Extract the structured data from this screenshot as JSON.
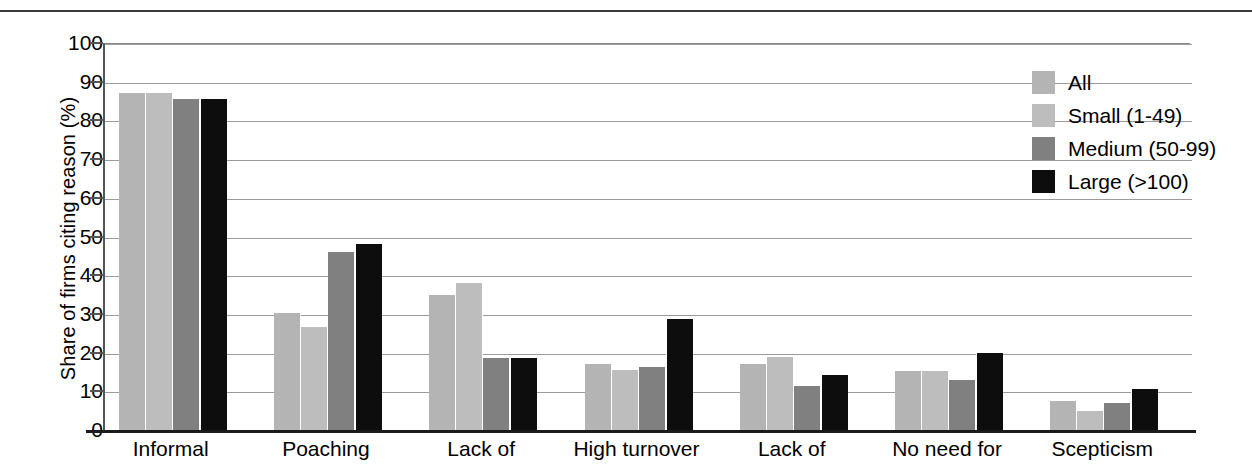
{
  "page": {
    "top_rule_cut_text": ""
  },
  "chart_data": {
    "type": "bar",
    "title": "",
    "xlabel": "",
    "ylabel": "Share of firms citing reason (%)",
    "ylim": [
      0,
      100
    ],
    "ytick_step": 10,
    "yticks": [
      0,
      10,
      20,
      30,
      40,
      50,
      60,
      70,
      80,
      90,
      100
    ],
    "grid": true,
    "legend_position": "top-right",
    "categories": [
      "Informal",
      "Poaching",
      "Lack of",
      "High turnover",
      "Lack of",
      "No need for",
      "Scepticism"
    ],
    "series": [
      {
        "name": "All",
        "color": "#b4b4b4",
        "values": [
          87.0,
          30.3,
          35.0,
          17.0,
          17.0,
          15.2,
          7.5
        ]
      },
      {
        "name": "Small (1-49)",
        "color": "#bdbdbd",
        "values": [
          87.0,
          26.5,
          38.0,
          15.5,
          18.8,
          15.2,
          5.0
        ]
      },
      {
        "name": "Medium (50-99)",
        "color": "#808080",
        "values": [
          85.5,
          46.0,
          18.5,
          16.3,
          11.5,
          13.0,
          7.0
        ]
      },
      {
        "name": "Large (>100)",
        "color": "#0d0d0d",
        "values": [
          85.5,
          48.0,
          18.5,
          28.8,
          14.2,
          20.0,
          10.5
        ]
      }
    ]
  }
}
